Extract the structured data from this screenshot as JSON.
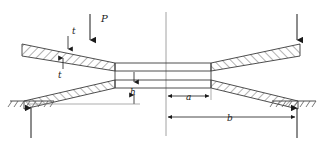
{
  "figure": {
    "type": "engineering-cross-section",
    "background_color": "#ffffff",
    "line_color": "#3a3a3a",
    "hatch_color": "#555555",
    "text_color": "#1a1a1a",
    "width": 322,
    "height": 144
  },
  "labels": {
    "load_p": "P",
    "thickness_t": "t",
    "height_h": "h",
    "inner_radius_a": "a",
    "outer_radius_b": "b"
  },
  "forces": [
    {
      "name": "applied-load-left",
      "label": "P",
      "direction": "down",
      "x": 90,
      "y_start": 14,
      "y_end": 44,
      "labelled": true
    },
    {
      "name": "applied-load-right",
      "label": "",
      "direction": "down",
      "x": 297,
      "y_start": 14,
      "y_end": 44,
      "labelled": false
    },
    {
      "name": "reaction-left",
      "label": "",
      "direction": "up",
      "x": 31,
      "y_start": 138,
      "y_end": 104,
      "labelled": false
    },
    {
      "name": "reaction-right",
      "label": "",
      "direction": "up",
      "x": 297,
      "y_start": 138,
      "y_end": 104,
      "labelled": false
    }
  ],
  "dimensions": [
    {
      "name": "thickness-t",
      "label": "t",
      "orientation": "vertical",
      "label_x": 71,
      "label_y": 38,
      "arrow_x": 68,
      "top_y": 43,
      "bottom_y": 57
    },
    {
      "name": "height-h",
      "label": "h",
      "orientation": "vertical",
      "label_x": 132,
      "label_y": 95,
      "arrow_x": 134,
      "top_y": 72,
      "bottom_y": 104
    },
    {
      "name": "inner-radius-a",
      "label": "a",
      "orientation": "horizontal",
      "label_x": 189,
      "label_y": 100,
      "y": 96,
      "left_x": 166,
      "right_x": 211
    },
    {
      "name": "outer-radius-b",
      "label": "b",
      "orientation": "horizontal",
      "label_x": 230,
      "label_y": 120,
      "y": 117,
      "left_x": 166,
      "right_x": 297
    }
  ],
  "geometry": {
    "center_axis_x": 166,
    "center_axis_top": 12,
    "center_axis_bottom": 136,
    "center_plate": {
      "left_x": 115,
      "right_x": 211,
      "top_y": 63,
      "mid_y": 71,
      "bottom_y": 88
    },
    "supports": [
      {
        "name": "ground-support-left",
        "x": 10,
        "y": 100,
        "width": 44
      },
      {
        "name": "ground-support-right",
        "x": 272,
        "y": 100,
        "width": 44
      }
    ]
  },
  "beams": [
    {
      "name": "beam-upper-left",
      "slope": "down-right"
    },
    {
      "name": "beam-lower-left",
      "slope": "up-right"
    },
    {
      "name": "beam-upper-right",
      "slope": "up-right"
    },
    {
      "name": "beam-lower-right",
      "slope": "down-right"
    }
  ]
}
